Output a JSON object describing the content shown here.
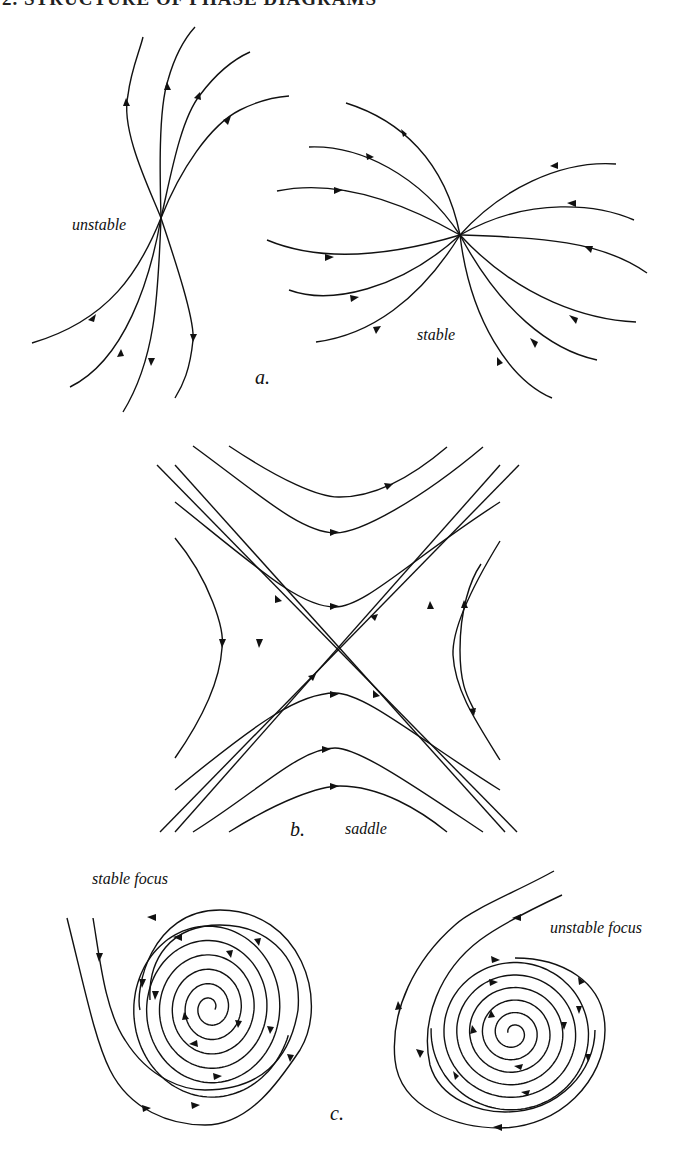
{
  "header": {
    "text": "2. STRUCTURE OF PHASE DIAGRAMS"
  },
  "panels": [
    {
      "id": "a",
      "caption": "a.",
      "labels": [
        "unstable",
        "stable"
      ]
    },
    {
      "id": "b",
      "caption": "b.",
      "labels": [
        "saddle"
      ]
    },
    {
      "id": "c",
      "caption": "c.",
      "labels": [
        "stable focus",
        "unstable focus"
      ]
    }
  ],
  "colors": {
    "ink": "#111111",
    "background": "#ffffff"
  }
}
